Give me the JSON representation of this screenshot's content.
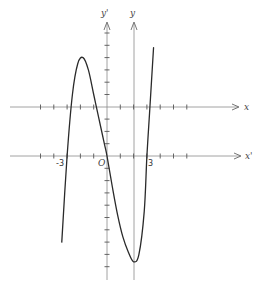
{
  "diagram": {
    "title": "",
    "labels": {
      "y_prime_axis": "y'",
      "y_axis": "y",
      "x_axis": "x",
      "x_prime_axis": "x'",
      "minus_three": "-3",
      "origin": "O",
      "three": "3"
    },
    "colors": {
      "curve": "#2a2a2a",
      "axis": "#8a8a8a",
      "background": "#ffffff"
    }
  },
  "chart_data": {
    "type": "line",
    "title": "",
    "xlabel": "x'",
    "ylabel": "y'",
    "secondary_axes": {
      "xlabel": "x",
      "ylabel": "y",
      "origin_in_primary_units": [
        2,
        4
      ]
    },
    "x_ticks_labeled": [
      -3,
      0,
      3
    ],
    "roots_primary": [
      -3,
      0,
      3
    ],
    "xlim": [
      -7,
      10
    ],
    "ylim": [
      -9,
      10
    ],
    "grid": false,
    "series": [
      {
        "name": "curve",
        "x": [
          -3.4,
          -3.0,
          -2.6,
          -2.2,
          -1.8,
          -1.4,
          -1.0,
          -0.6,
          -0.2,
          0.0,
          0.4,
          0.8,
          1.2,
          1.6,
          2.0,
          2.4,
          2.8,
          3.0,
          3.2,
          3.5
        ],
        "y": [
          -7.0,
          0.0,
          5.0,
          7.5,
          8.0,
          7.0,
          5.0,
          3.0,
          1.0,
          0.0,
          -2.5,
          -4.8,
          -6.6,
          -7.8,
          -8.6,
          -8.0,
          -4.5,
          0.0,
          3.5,
          8.8
        ]
      }
    ]
  }
}
